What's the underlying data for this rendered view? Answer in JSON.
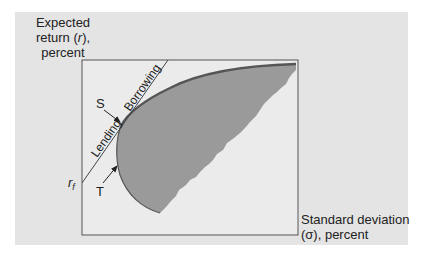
{
  "diagram": {
    "y_axis_label": [
      "Expected",
      "return (r),",
      "percent"
    ],
    "x_axis_label": [
      "Standard deviation",
      "(σ), percent"
    ],
    "risk_free_label": "r",
    "risk_free_subscript": "f",
    "line_labels": {
      "lending": "Lending",
      "borrowing": "Borrowing"
    },
    "point_labels": {
      "S": "S",
      "T": "T"
    },
    "colors": {
      "panel_background": "#e4e4e4",
      "plot_background": "#ebebeb",
      "feasible_region": "#9a9a9a",
      "frontier": "#555555",
      "lines": "#444444"
    }
  }
}
